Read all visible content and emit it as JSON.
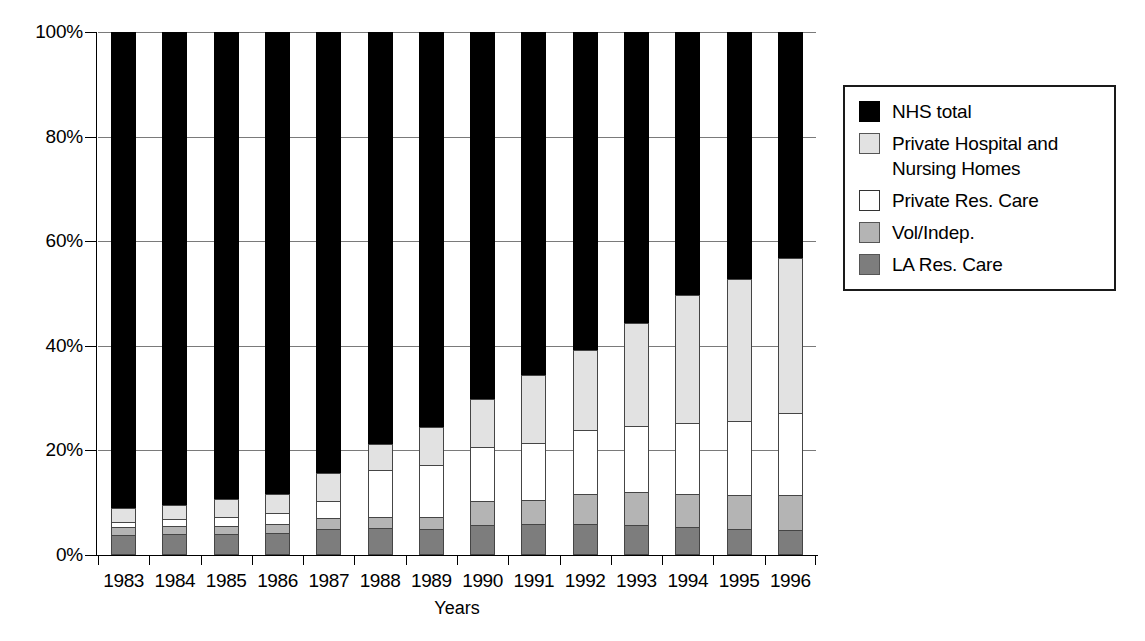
{
  "chart_data": {
    "type": "bar",
    "subtype": "stacked-percentage",
    "title": "",
    "xlabel": "Years",
    "ylabel": "",
    "ylim": [
      0,
      100
    ],
    "ytick_labels": [
      "100%",
      "80%",
      "60%",
      "40%",
      "20%",
      "0%"
    ],
    "ytick_values": [
      100,
      80,
      60,
      40,
      20,
      0
    ],
    "grid": true,
    "legend_position": "right",
    "categories": [
      "1983",
      "1984",
      "1985",
      "1986",
      "1987",
      "1988",
      "1989",
      "1990",
      "1991",
      "1992",
      "1993",
      "1994",
      "1995",
      "1996"
    ],
    "stack_order_bottom_to_top": [
      "LA Res. Care",
      "Vol/Indep.",
      "Private Res. Care",
      "Private Hospital and Nursing Homes",
      "NHS total"
    ],
    "series": [
      {
        "name": "LA Res. Care",
        "key": "la",
        "color": "#7d7d7d",
        "values": [
          3.8,
          4.1,
          4.0,
          4.2,
          5.0,
          5.2,
          5.0,
          5.7,
          6.0,
          6.0,
          5.8,
          5.3,
          4.9,
          4.7
        ]
      },
      {
        "name": "Vol/Indep.",
        "key": "vol",
        "color": "#b4b4b4",
        "values": [
          1.5,
          1.5,
          1.6,
          1.7,
          2.0,
          2.1,
          2.3,
          4.6,
          4.6,
          5.6,
          6.3,
          6.4,
          6.5,
          6.7
        ]
      },
      {
        "name": "Private Res. Care",
        "key": "privres",
        "color": "#ffffff",
        "values": [
          1.1,
          1.3,
          1.6,
          2.1,
          3.3,
          8.9,
          10.0,
          10.4,
          10.8,
          12.3,
          12.6,
          13.6,
          14.3,
          15.7
        ]
      },
      {
        "name": "Private Hospital and Nursing Homes",
        "key": "privhosp",
        "color": "#e2e2e2",
        "values": [
          2.5,
          2.7,
          3.5,
          3.7,
          5.3,
          5.1,
          7.2,
          9.2,
          13.0,
          15.3,
          19.7,
          24.4,
          27.1,
          29.6
        ]
      },
      {
        "name": "NHS total",
        "key": "nhs",
        "color": "#000000",
        "values": [
          91.1,
          90.4,
          89.3,
          88.3,
          84.4,
          78.7,
          75.5,
          70.1,
          65.6,
          60.8,
          55.6,
          50.3,
          47.2,
          43.3
        ]
      }
    ]
  },
  "axes": {
    "x_title": "Years",
    "y_ticks": [
      {
        "label": "100%",
        "value": 100
      },
      {
        "label": "80%",
        "value": 80
      },
      {
        "label": "60%",
        "value": 60
      },
      {
        "label": "40%",
        "value": 40
      },
      {
        "label": "20%",
        "value": 20
      },
      {
        "label": "0%",
        "value": 0
      }
    ]
  },
  "legend": {
    "items": [
      {
        "label": "NHS total",
        "key": "nhs"
      },
      {
        "label": "Private Hospital and\nNursing Homes",
        "key": "privhosp"
      },
      {
        "label": "Private Res. Care",
        "key": "privres"
      },
      {
        "label": "Vol/Indep.",
        "key": "vol"
      },
      {
        "label": "LA Res. Care",
        "key": "la"
      }
    ]
  }
}
